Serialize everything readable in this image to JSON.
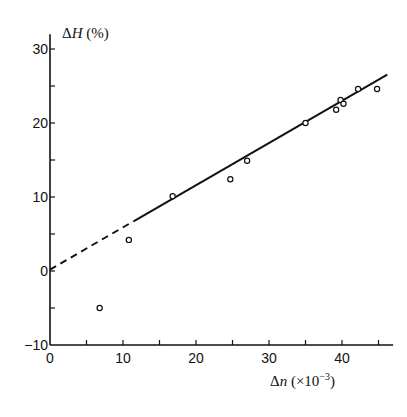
{
  "chart_data": {
    "type": "scatter",
    "title": "",
    "xlabel": "Δn (×10⁻³)",
    "ylabel": "ΔH (%)",
    "xlabel_parts": {
      "main": "Δ",
      "var": "n",
      "paren_open": " (×10",
      "exp": "−3",
      "paren_close": ")"
    },
    "ylabel_parts": {
      "main": "Δ",
      "var": "H",
      "rest": " (%)"
    },
    "xlim": [
      0,
      47
    ],
    "ylim": [
      -10,
      32
    ],
    "x_ticks": [
      0,
      10,
      20,
      30,
      40
    ],
    "x_minor_ticks": [
      5,
      15,
      25,
      35,
      45
    ],
    "y_ticks": [
      -10,
      0,
      10,
      20,
      30
    ],
    "y_minor_ticks": [
      -5,
      5,
      15,
      25
    ],
    "grid": false,
    "legend": null,
    "series": [
      {
        "name": "measurements",
        "marker": "open-circle",
        "points": [
          {
            "x": 6.8,
            "y": -5.0
          },
          {
            "x": 10.8,
            "y": 4.2
          },
          {
            "x": 16.8,
            "y": 10.1
          },
          {
            "x": 24.7,
            "y": 12.4
          },
          {
            "x": 27.0,
            "y": 14.9
          },
          {
            "x": 35.0,
            "y": 20.0
          },
          {
            "x": 39.2,
            "y": 21.8
          },
          {
            "x": 39.8,
            "y": 23.1
          },
          {
            "x": 40.2,
            "y": 22.6
          },
          {
            "x": 42.2,
            "y": 24.6
          },
          {
            "x": 44.8,
            "y": 24.6
          }
        ]
      }
    ],
    "fit_line": {
      "slope": 0.57,
      "intercept": 0.2,
      "dashed_range": [
        0,
        11.5
      ],
      "solid_range": [
        11.5,
        46.2
      ]
    }
  }
}
